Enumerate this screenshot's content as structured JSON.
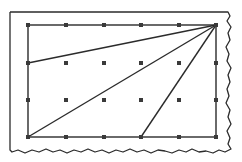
{
  "diagram": {
    "type": "geoboard-grid-with-triangles",
    "colors": {
      "background": "#ffffff",
      "stroke": "#2b2b2b",
      "dot": "#3a3a3a"
    },
    "outer_frame": {
      "left": 10,
      "top": 12,
      "right_edge": "torn-wavy",
      "bottom_edge": "torn-wavy"
    },
    "grid": {
      "columns_x": [
        28,
        66,
        104,
        141,
        179,
        216
      ],
      "rows_y": [
        25,
        63,
        100,
        137
      ],
      "dot_size": 4
    },
    "rectangle": {
      "x1": 28,
      "y1": 25,
      "x2": 216,
      "y2": 137
    },
    "apex": {
      "x": 216,
      "y": 25
    },
    "segments_from_apex": [
      {
        "to": {
          "x": 28,
          "y": 63
        }
      },
      {
        "to": {
          "x": 28,
          "y": 137
        }
      },
      {
        "to": {
          "x": 141,
          "y": 137
        }
      }
    ]
  }
}
